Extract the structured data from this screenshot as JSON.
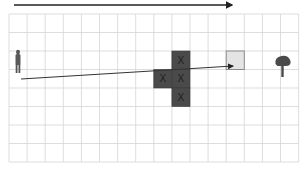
{
  "diagram": {
    "type": "grid-navigation",
    "grid": {
      "cols": 16,
      "rows": 8,
      "left": 9,
      "top": 14,
      "cell_w": 18.1,
      "cell_h": 18.5,
      "line_color": "#d4d4d4"
    },
    "top_arrow": {
      "x1": 14,
      "y1": 5,
      "x2": 232,
      "y2": 5,
      "color": "#222222"
    },
    "obstacles": [
      {
        "col": 9,
        "row": 2,
        "label": "X"
      },
      {
        "col": 8,
        "row": 3,
        "label": "X"
      },
      {
        "col": 9,
        "row": 3,
        "label": "X"
      },
      {
        "col": 9,
        "row": 4,
        "label": "X"
      }
    ],
    "obstacle_color": "#4a4a4a",
    "obstacle_label_color": "#1e1e1e",
    "goal": {
      "col": 12,
      "row": 2,
      "fill": "#e4e4e4",
      "border": "#8a8a8a"
    },
    "path_arrow": {
      "x1": 21,
      "y1": 79,
      "x2": 233,
      "y2": 66,
      "color": "#333333"
    },
    "agent": {
      "icon": "person-icon",
      "col": 0,
      "row": 2
    },
    "landmark": {
      "icon": "tree-icon",
      "col": 15,
      "row": 2
    }
  }
}
